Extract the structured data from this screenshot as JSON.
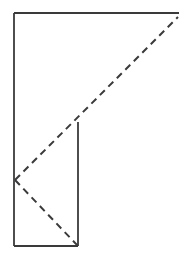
{
  "figure": {
    "canvas": {
      "width": 191,
      "height": 263,
      "background_color": "#ffffff"
    },
    "style": {
      "solid_stroke_color": "#3a3a3c",
      "dashed_stroke_color": "#3a3a3c",
      "solid_stroke_width": 1.8,
      "dashed_stroke_width": 2.0,
      "dash_pattern": "7,5",
      "line_cap": "butt"
    },
    "points": {
      "top_left": {
        "x": 14,
        "y": 13
      },
      "top_right": {
        "x": 179,
        "y": 13
      },
      "bottom_left": {
        "x": 14,
        "y": 246
      },
      "bottom_inner_right": {
        "x": 78,
        "y": 246
      },
      "inner_vertical_top": {
        "x": 78,
        "y": 122
      },
      "left_vertex": {
        "x": 15,
        "y": 180
      },
      "dashed_upper_end": {
        "x": 178,
        "y": 17
      }
    },
    "segments": [
      {
        "name": "top-horizontal-line",
        "kind": "solid",
        "x1": 14,
        "y1": 13,
        "x2": 179,
        "y2": 13
      },
      {
        "name": "left-vertical-line",
        "kind": "solid",
        "x1": 14,
        "y1": 13,
        "x2": 14,
        "y2": 246
      },
      {
        "name": "bottom-horizontal-line",
        "kind": "solid",
        "x1": 14,
        "y1": 246,
        "x2": 78,
        "y2": 246
      },
      {
        "name": "inner-vertical-line",
        "kind": "solid",
        "x1": 78,
        "y1": 122,
        "x2": 78,
        "y2": 246
      },
      {
        "name": "dashed-diagonal-upper",
        "kind": "dashed",
        "x1": 15,
        "y1": 180,
        "x2": 178,
        "y2": 17
      },
      {
        "name": "dashed-diagonal-lower",
        "kind": "dashed",
        "x1": 15,
        "y1": 180,
        "x2": 78,
        "y2": 246
      }
    ]
  }
}
